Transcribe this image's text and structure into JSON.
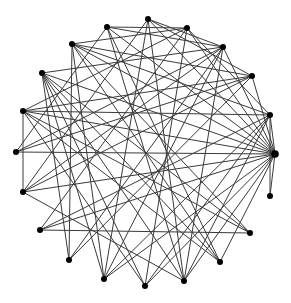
{
  "diagram": {
    "type": "network-graph",
    "layout": "circular",
    "background": "#ffffff",
    "edge_color": "#3a3a3a",
    "node_color": "#000000",
    "node_radius": 3,
    "nodes": [
      {
        "id": 0,
        "x": 275,
        "y": 154
      },
      {
        "id": 1,
        "x": 270,
        "y": 115
      },
      {
        "id": 2,
        "x": 252,
        "y": 76
      },
      {
        "id": 3,
        "x": 223,
        "y": 47
      },
      {
        "id": 4,
        "x": 187,
        "y": 28
      },
      {
        "id": 5,
        "x": 148,
        "y": 19
      },
      {
        "id": 6,
        "x": 107,
        "y": 27
      },
      {
        "id": 7,
        "x": 72,
        "y": 44
      },
      {
        "id": 8,
        "x": 42,
        "y": 73
      },
      {
        "id": 9,
        "x": 23,
        "y": 111
      },
      {
        "id": 10,
        "x": 16,
        "y": 152
      },
      {
        "id": 11,
        "x": 23,
        "y": 192
      },
      {
        "id": 12,
        "x": 40,
        "y": 230
      },
      {
        "id": 13,
        "x": 69,
        "y": 260
      },
      {
        "id": 14,
        "x": 104,
        "y": 279
      },
      {
        "id": 15,
        "x": 145,
        "y": 286
      },
      {
        "id": 16,
        "x": 184,
        "y": 281
      },
      {
        "id": 17,
        "x": 220,
        "y": 262
      },
      {
        "id": 18,
        "x": 250,
        "y": 233
      },
      {
        "id": 19,
        "x": 270,
        "y": 196
      }
    ],
    "edges": [
      [
        0,
        1
      ],
      [
        0,
        2
      ],
      [
        0,
        3
      ],
      [
        0,
        5
      ],
      [
        0,
        7
      ],
      [
        0,
        8
      ],
      [
        0,
        9
      ],
      [
        0,
        10
      ],
      [
        0,
        11
      ],
      [
        0,
        12
      ],
      [
        0,
        14
      ],
      [
        0,
        15
      ],
      [
        0,
        16
      ],
      [
        0,
        17
      ],
      [
        0,
        19
      ],
      [
        0,
        4
      ],
      [
        0,
        6
      ],
      [
        1,
        9
      ],
      [
        1,
        12
      ],
      [
        1,
        14
      ],
      [
        1,
        4
      ],
      [
        1,
        7
      ],
      [
        1,
        19
      ],
      [
        2,
        7
      ],
      [
        2,
        10
      ],
      [
        2,
        13
      ],
      [
        2,
        5
      ],
      [
        3,
        6
      ],
      [
        3,
        8
      ],
      [
        3,
        11
      ],
      [
        3,
        16
      ],
      [
        4,
        7
      ],
      [
        4,
        9
      ],
      [
        4,
        12
      ],
      [
        4,
        15
      ],
      [
        5,
        11
      ],
      [
        5,
        14
      ],
      [
        5,
        3
      ],
      [
        6,
        10
      ],
      [
        6,
        16
      ],
      [
        6,
        4
      ],
      [
        7,
        17
      ],
      [
        7,
        14
      ],
      [
        7,
        13
      ],
      [
        8,
        15
      ],
      [
        8,
        18
      ],
      [
        8,
        16
      ],
      [
        8,
        13
      ],
      [
        8,
        14
      ],
      [
        9,
        17
      ],
      [
        9,
        11
      ],
      [
        9,
        15
      ],
      [
        9,
        2
      ],
      [
        10,
        3
      ],
      [
        11,
        2
      ],
      [
        11,
        16
      ],
      [
        12,
        1
      ],
      [
        12,
        18
      ],
      [
        12,
        4
      ],
      [
        13,
        3
      ],
      [
        13,
        2
      ],
      [
        14,
        3
      ],
      [
        15,
        1
      ],
      [
        16,
        1
      ],
      [
        16,
        5
      ],
      [
        17,
        8
      ],
      [
        17,
        6
      ],
      [
        18,
        7
      ],
      [
        18,
        9
      ]
    ]
  }
}
